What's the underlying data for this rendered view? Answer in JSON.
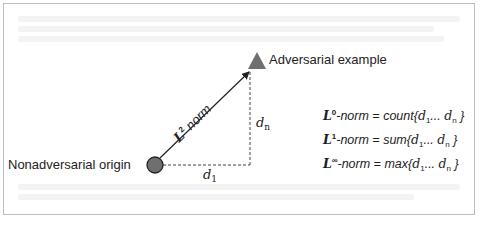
{
  "diagram": {
    "origin_label": "Nonadversarial origin",
    "target_label": "Adversarial example",
    "vector_label": {
      "base": "L",
      "superscript": "2",
      "suffix": " norm"
    },
    "axis_x_label": {
      "base": "d",
      "subscript": "1"
    },
    "axis_y_label": {
      "base": "d",
      "subscript": "n"
    },
    "norms": [
      {
        "base": "L",
        "superscript": "0",
        "text": "-norm = count{",
        "args": [
          "d",
          "1",
          "... ",
          "d",
          "n"
        ],
        "close": " }"
      },
      {
        "base": "L",
        "superscript": "1",
        "text": "-norm = sum{",
        "args": [
          "d",
          "1",
          "... ",
          "d",
          "n"
        ],
        "close": " }"
      },
      {
        "base": "L",
        "superscript": "∞",
        "text": "-norm = max{",
        "args": [
          "d",
          "1",
          "... ",
          "d",
          "n"
        ],
        "close": " }"
      }
    ],
    "colors": {
      "origin_fill": "#6f6f6f",
      "target_fill": "#6f6f6f",
      "line": "#333333",
      "frame_border": "#bdbdbd"
    },
    "icons": {
      "origin_marker": "circle",
      "target_marker": "triangle",
      "vector_arrow": "arrow"
    }
  }
}
